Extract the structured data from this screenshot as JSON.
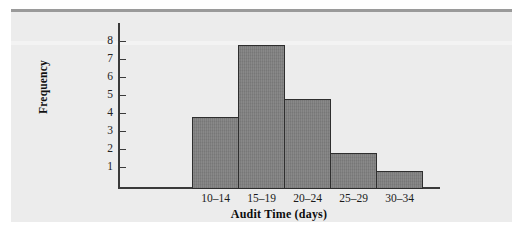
{
  "figure": {
    "background_color": "#ececec",
    "bar_fill_color": "#7d7d7d",
    "bar_edge_color": "#2e2e2e",
    "axis_color": "#3a3a3a",
    "scan_artifact_left": "",
    "scan_artifact_right": ""
  },
  "chart_data": {
    "type": "bar",
    "title": "",
    "subtitle": "",
    "xlabel": "Audit Time (days)",
    "ylabel": "Frequency",
    "categories": [
      "10–14",
      "15–19",
      "20–24",
      "25–29",
      "30–34"
    ],
    "values": [
      4,
      8,
      5,
      2,
      1
    ],
    "series": [
      {
        "name": "Frequency",
        "values": [
          4,
          8,
          5,
          2,
          1
        ]
      }
    ],
    "ylim": [
      0,
      8
    ],
    "ytick_labels": [
      "8",
      "7",
      "6",
      "5",
      "4",
      "3",
      "2",
      "1"
    ],
    "ytick_values": [
      8,
      7,
      6,
      5,
      4,
      3,
      2,
      1
    ],
    "grid": false,
    "legend": false,
    "legend_position": "none",
    "annotations": []
  }
}
